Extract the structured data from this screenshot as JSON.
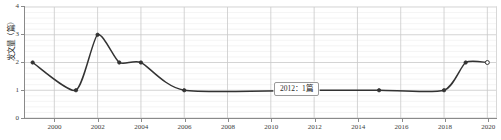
{
  "chart_data": {
    "type": "line",
    "title": "发表年度趋势",
    "xlabel": "",
    "ylabel": "发文量（篇）",
    "xlim": [
      1998.6,
      2020.4
    ],
    "ylim": [
      0,
      4
    ],
    "grid": true,
    "legend": false,
    "x_ticks": [
      "2000",
      "2002",
      "2004",
      "2006",
      "2008",
      "2010",
      "2012",
      "2014",
      "2016",
      "2018",
      "2020"
    ],
    "x_tick_values": [
      2000,
      2002,
      2004,
      2006,
      2008,
      2010,
      2012,
      2014,
      2016,
      2018,
      2020
    ],
    "y_ticks": [
      "0",
      "1",
      "2",
      "3",
      "4"
    ],
    "y_tick_values": [
      0,
      1,
      2,
      3,
      4
    ],
    "x": [
      1999,
      2001,
      2002,
      2003,
      2004,
      2006,
      2012,
      2015,
      2018,
      2019,
      2020
    ],
    "values": [
      2,
      1,
      3,
      2,
      2,
      1,
      1,
      1,
      1,
      2,
      2
    ],
    "series": [
      {
        "name": "发文量",
        "color": "#333333",
        "x": [
          1999,
          2001,
          2002,
          2003,
          2004,
          2006,
          2012,
          2015,
          2018,
          2019,
          2020
        ],
        "values": [
          2,
          1,
          3,
          2,
          2,
          1,
          1,
          1,
          1,
          2,
          2
        ]
      }
    ],
    "annotations": [
      {
        "name": "tooltip",
        "text": "2012：1篇",
        "year": 2012,
        "value": 1
      }
    ]
  }
}
